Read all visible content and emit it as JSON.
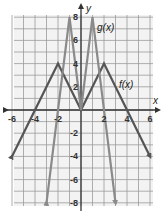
{
  "chart_data": {
    "type": "line",
    "title": "",
    "xlabel": "x",
    "ylabel": "y",
    "xlim": [
      -6,
      6
    ],
    "ylim": [
      -8,
      8
    ],
    "grid": true,
    "x_ticks": [
      -6,
      -4,
      -2,
      2,
      4,
      6
    ],
    "y_ticks": [
      8,
      6,
      4,
      2,
      -2,
      -4,
      -6,
      -8
    ],
    "series": [
      {
        "name": "f(x)",
        "color": "#555555",
        "points": [
          [
            -6,
            -4
          ],
          [
            -2,
            4
          ],
          [
            0,
            0
          ],
          [
            2,
            4
          ],
          [
            6,
            -4
          ]
        ],
        "arrows": "both-ends"
      },
      {
        "name": "g(x)",
        "color": "#8a8a8a",
        "points": [
          [
            -3,
            -8
          ],
          [
            -1,
            8
          ],
          [
            0,
            0
          ],
          [
            1,
            8
          ],
          [
            3,
            -8
          ]
        ],
        "arrows": "both-ends"
      }
    ],
    "annotations": [
      {
        "text": "g(x)",
        "x": 2.2,
        "y": 7
      },
      {
        "text": "f(x)",
        "x": 4.0,
        "y": 2.1
      }
    ]
  },
  "labels": {
    "x_axis": "x",
    "y_axis": "y",
    "f_label": "f(x)",
    "g_label": "g(x)",
    "xt": [
      "-6",
      "-4",
      "-2",
      "2",
      "4",
      "6"
    ],
    "yt": [
      "8",
      "6",
      "4",
      "2",
      "-2",
      "-4",
      "-6",
      "-8"
    ]
  }
}
